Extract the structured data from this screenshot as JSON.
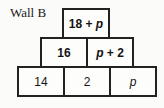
{
  "page": {
    "label": "Wall B"
  },
  "wall": {
    "description": "number-wall pyramid, each upper brick sits over the joint of the two below",
    "rows": [
      {
        "cells": [
          {
            "pre": "18 + ",
            "var": "p",
            "post": ""
          }
        ]
      },
      {
        "cells": [
          {
            "pre": "16",
            "var": "",
            "post": ""
          },
          {
            "pre": "",
            "var": "p",
            "post": " + 2"
          }
        ]
      },
      {
        "cells": [
          {
            "pre": "14",
            "var": "",
            "post": ""
          },
          {
            "pre": "2",
            "var": "",
            "post": ""
          },
          {
            "pre": "",
            "var": "p",
            "post": ""
          }
        ]
      }
    ]
  },
  "colors": {
    "background": "#fbfbf9",
    "box_fill": "#fdfdfc",
    "border": "#222222",
    "text": "#141414"
  }
}
